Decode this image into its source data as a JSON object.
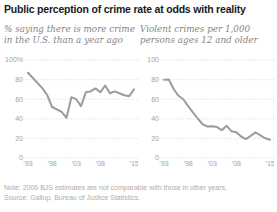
{
  "title": "Public perception of crime rate at odds with reality",
  "note": "Note: 2006 BJS estimates are not comparable with those in other years.",
  "source": "Source: Gallup, Bureau of Justice Statistics.",
  "colors": {
    "line": "#9c9c9c",
    "grid": "#d6d6d6",
    "axis_text": "#a3a3a3",
    "subtitle_text": "#858585",
    "title_text": "#1a1a1a",
    "note_text": "#adadad",
    "background": "#ffffff"
  },
  "chart_data": [
    {
      "type": "line",
      "id": "gallup-perception",
      "title_lines": [
        "% saying there is more crime",
        "in the U.S. than a year ago"
      ],
      "xlabel": "",
      "ylabel": "",
      "xlim": [
        1993,
        2015
      ],
      "ylim": [
        0,
        100
      ],
      "grid": "dotted",
      "legend": "none",
      "x": [
        1993,
        1996,
        1997,
        1998,
        2000,
        2001,
        2002,
        2003,
        2004,
        2005,
        2006,
        2007,
        2008,
        2009,
        2010,
        2011,
        2013,
        2014,
        2015
      ],
      "values": [
        87,
        71,
        64,
        52,
        47,
        41,
        62,
        60,
        53,
        67,
        68,
        71,
        67,
        74,
        66,
        68,
        64,
        63,
        70
      ],
      "yticks": [
        {
          "value": 100,
          "label": "100%"
        },
        {
          "value": 80,
          "label": "80"
        },
        {
          "value": 60,
          "label": "60"
        },
        {
          "value": 40,
          "label": "40"
        },
        {
          "value": 20,
          "label": "20"
        },
        {
          "value": 0,
          "label": "0"
        }
      ],
      "xticks": [
        {
          "value": 1993,
          "label": "’93"
        },
        {
          "value": 1998,
          "label": "’98"
        },
        {
          "value": 2003,
          "label": "’03"
        },
        {
          "value": 2008,
          "label": "’08"
        },
        {
          "value": 2015,
          "label": "’15"
        }
      ]
    },
    {
      "type": "line",
      "id": "bjs-violent-crime",
      "title_lines": [
        "Violent crimes per 1,000",
        "persons ages 12 and older"
      ],
      "xlabel": "",
      "ylabel": "",
      "xlim": [
        1993,
        2015
      ],
      "ylim": [
        0,
        100
      ],
      "grid": "dotted",
      "legend": "none",
      "x": [
        1993,
        1994,
        1995,
        1996,
        1997,
        1998,
        1999,
        2000,
        2001,
        2002,
        2003,
        2004,
        2005,
        2006,
        2007,
        2008,
        2009,
        2010,
        2011,
        2012,
        2013,
        2014,
        2015
      ],
      "values": [
        79.8,
        80.1,
        70.4,
        63.5,
        60.0,
        53.0,
        46.5,
        40.3,
        34.6,
        32.1,
        32.3,
        31.5,
        28.4,
        33.0,
        27.2,
        26.2,
        21.9,
        19.3,
        22.6,
        26.1,
        23.2,
        20.1,
        18.6
      ],
      "yticks": [
        {
          "value": 100,
          "label": "100"
        },
        {
          "value": 80,
          "label": "80"
        },
        {
          "value": 60,
          "label": "60"
        },
        {
          "value": 40,
          "label": "40"
        },
        {
          "value": 20,
          "label": "20"
        },
        {
          "value": 0,
          "label": "0"
        }
      ],
      "xticks": [
        {
          "value": 1993,
          "label": "’93"
        },
        {
          "value": 1998,
          "label": "’98"
        },
        {
          "value": 2003,
          "label": "’03"
        },
        {
          "value": 2008,
          "label": "’08"
        },
        {
          "value": 2015,
          "label": "’15"
        }
      ]
    }
  ]
}
